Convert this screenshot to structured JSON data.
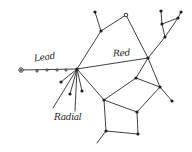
{
  "diagram": {
    "type": "hand-drawn network graph",
    "labels": {
      "lead": "Lead",
      "red": "Red",
      "radial": "Radial"
    },
    "colors": {
      "ink": "#1f1f1f",
      "background": "#ffffff"
    },
    "nodes": [
      {
        "id": "hub",
        "x": 77,
        "y": 69,
        "style": "filled"
      },
      {
        "id": "left-end",
        "x": 21,
        "y": 70,
        "style": "ring"
      },
      {
        "id": "lead-dot-1",
        "x": 37,
        "y": 71,
        "style": "small"
      },
      {
        "id": "lead-dot-2",
        "x": 47,
        "y": 70,
        "style": "small"
      },
      {
        "id": "lead-dot-3",
        "x": 57,
        "y": 70,
        "style": "small"
      },
      {
        "id": "lead-dot-4",
        "x": 66,
        "y": 70,
        "style": "small"
      },
      {
        "id": "top-a",
        "x": 95,
        "y": 12,
        "style": "filled"
      },
      {
        "id": "top-b",
        "x": 101,
        "y": 31,
        "style": "filled"
      },
      {
        "id": "top-c",
        "x": 126,
        "y": 15,
        "style": "open"
      },
      {
        "id": "red-end",
        "x": 148,
        "y": 58,
        "style": "filled"
      },
      {
        "id": "tr-1",
        "x": 161,
        "y": 11,
        "style": "filled"
      },
      {
        "id": "tr-2",
        "x": 181,
        "y": 12,
        "style": "filled"
      },
      {
        "id": "tr-3",
        "x": 162,
        "y": 24,
        "style": "filled"
      },
      {
        "id": "tr-4",
        "x": 178,
        "y": 18,
        "style": "filled"
      },
      {
        "id": "tr-5",
        "x": 165,
        "y": 37,
        "style": "filled"
      },
      {
        "id": "mid-1",
        "x": 136,
        "y": 78,
        "style": "filled"
      },
      {
        "id": "mid-2",
        "x": 160,
        "y": 87,
        "style": "filled"
      },
      {
        "id": "mid-3",
        "x": 172,
        "y": 101,
        "style": "filled"
      },
      {
        "id": "mid-4",
        "x": 104,
        "y": 100,
        "style": "filled"
      },
      {
        "id": "mid-5",
        "x": 137,
        "y": 112,
        "style": "filled"
      },
      {
        "id": "bot-1",
        "x": 106,
        "y": 131,
        "style": "filled"
      },
      {
        "id": "bot-2",
        "x": 138,
        "y": 134,
        "style": "filled"
      },
      {
        "id": "bot-3",
        "x": 97,
        "y": 143,
        "style": "none"
      },
      {
        "id": "rad-1",
        "x": 61,
        "y": 82,
        "style": "filled"
      },
      {
        "id": "rad-2",
        "x": 70,
        "y": 94,
        "style": "filled"
      },
      {
        "id": "rad-3",
        "x": 82,
        "y": 91,
        "style": "filled"
      },
      {
        "id": "rad-4",
        "x": 53,
        "y": 108,
        "style": "none"
      },
      {
        "id": "rad-5",
        "x": 75,
        "y": 111,
        "style": "none"
      }
    ],
    "edges": [
      [
        "left-end",
        "hub"
      ],
      [
        "hub",
        "top-b"
      ],
      [
        "top-b",
        "top-a"
      ],
      [
        "top-b",
        "top-c"
      ],
      [
        "top-c",
        "red-end"
      ],
      [
        "hub",
        "red-end"
      ],
      [
        "red-end",
        "tr-5"
      ],
      [
        "tr-5",
        "tr-3"
      ],
      [
        "tr-3",
        "tr-1"
      ],
      [
        "tr-3",
        "tr-4"
      ],
      [
        "tr-4",
        "tr-2"
      ],
      [
        "tr-4",
        "tr-5"
      ],
      [
        "red-end",
        "mid-1"
      ],
      [
        "red-end",
        "mid-2"
      ],
      [
        "mid-2",
        "mid-3"
      ],
      [
        "mid-1",
        "mid-2"
      ],
      [
        "mid-1",
        "mid-4"
      ],
      [
        "hub",
        "mid-4"
      ],
      [
        "mid-4",
        "mid-5"
      ],
      [
        "mid-5",
        "mid-2"
      ],
      [
        "mid-4",
        "bot-1"
      ],
      [
        "bot-1",
        "bot-2"
      ],
      [
        "bot-2",
        "mid-5"
      ],
      [
        "bot-1",
        "bot-3"
      ],
      [
        "hub",
        "rad-1"
      ],
      [
        "hub",
        "rad-2"
      ],
      [
        "hub",
        "rad-3"
      ],
      [
        "hub",
        "rad-4"
      ],
      [
        "hub",
        "rad-5"
      ]
    ]
  }
}
